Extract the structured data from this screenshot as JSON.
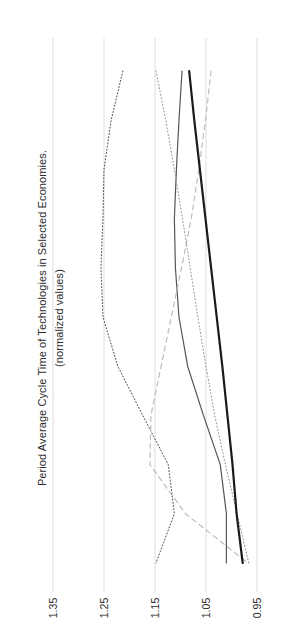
{
  "chart_data": {
    "type": "line",
    "title": "Period Average Cycle Time of Technologies in Selected Economies.",
    "subtitle": "(normalized values)",
    "orientation": "rotated-90-ccw",
    "xlabel": "",
    "ylabel": "normalized values",
    "value_axis_ticks": [
      "1.35",
      "1.25",
      "1.15",
      "1.05",
      "0.95"
    ],
    "value_axis_tick_values": [
      1.35,
      1.25,
      1.15,
      1.05,
      0.95
    ],
    "axis_range": [
      0.9,
      1.4
    ],
    "grid": true,
    "gridlines_at": [
      1.35,
      1.25,
      1.15,
      1.05,
      0.95
    ],
    "legend": "none",
    "legend_position": "none",
    "n_categories": 11,
    "categories": [
      "1",
      "2",
      "3",
      "4",
      "5",
      "6",
      "7",
      "8",
      "9",
      "10",
      "11"
    ],
    "series": [
      {
        "name": "series-dotted-fine-upper",
        "style": "dotted",
        "color": "#4a4a4a",
        "width": 1.0,
        "values": [
          1.213,
          1.236,
          1.25,
          1.252,
          1.256,
          1.252,
          1.223,
          1.174,
          1.124,
          1.112,
          1.148
        ]
      },
      {
        "name": "series-solid-medium",
        "style": "solid",
        "color": "#555555",
        "width": 1.2,
        "values": [
          1.097,
          1.103,
          1.108,
          1.112,
          1.11,
          1.103,
          1.086,
          1.055,
          1.022,
          1.01,
          1.01
        ]
      },
      {
        "name": "series-dashed-light",
        "style": "dashed",
        "color": "#bdbdbd",
        "width": 1.2,
        "values": [
          1.04,
          1.051,
          1.064,
          1.079,
          1.098,
          1.118,
          1.138,
          1.158,
          1.16,
          1.09,
          0.968
        ]
      },
      {
        "name": "series-dotted-fine-lower",
        "style": "dotted",
        "color": "#9a9a9a",
        "width": 1.1,
        "values": [
          1.148,
          1.129,
          1.112,
          1.096,
          1.081,
          1.066,
          1.05,
          1.033,
          1.012,
          0.989,
          0.966
        ]
      },
      {
        "name": "series-solid-thick-dark",
        "style": "solid",
        "color": "#1a1a1a",
        "width": 2.2,
        "values": [
          1.083,
          1.073,
          1.062,
          1.051,
          1.04,
          1.029,
          1.018,
          1.008,
          0.998,
          0.99,
          0.978
        ]
      }
    ],
    "colors": {
      "gridline": "#d9d9d9",
      "text": "#2b2b2b",
      "background": "#ffffff"
    }
  }
}
